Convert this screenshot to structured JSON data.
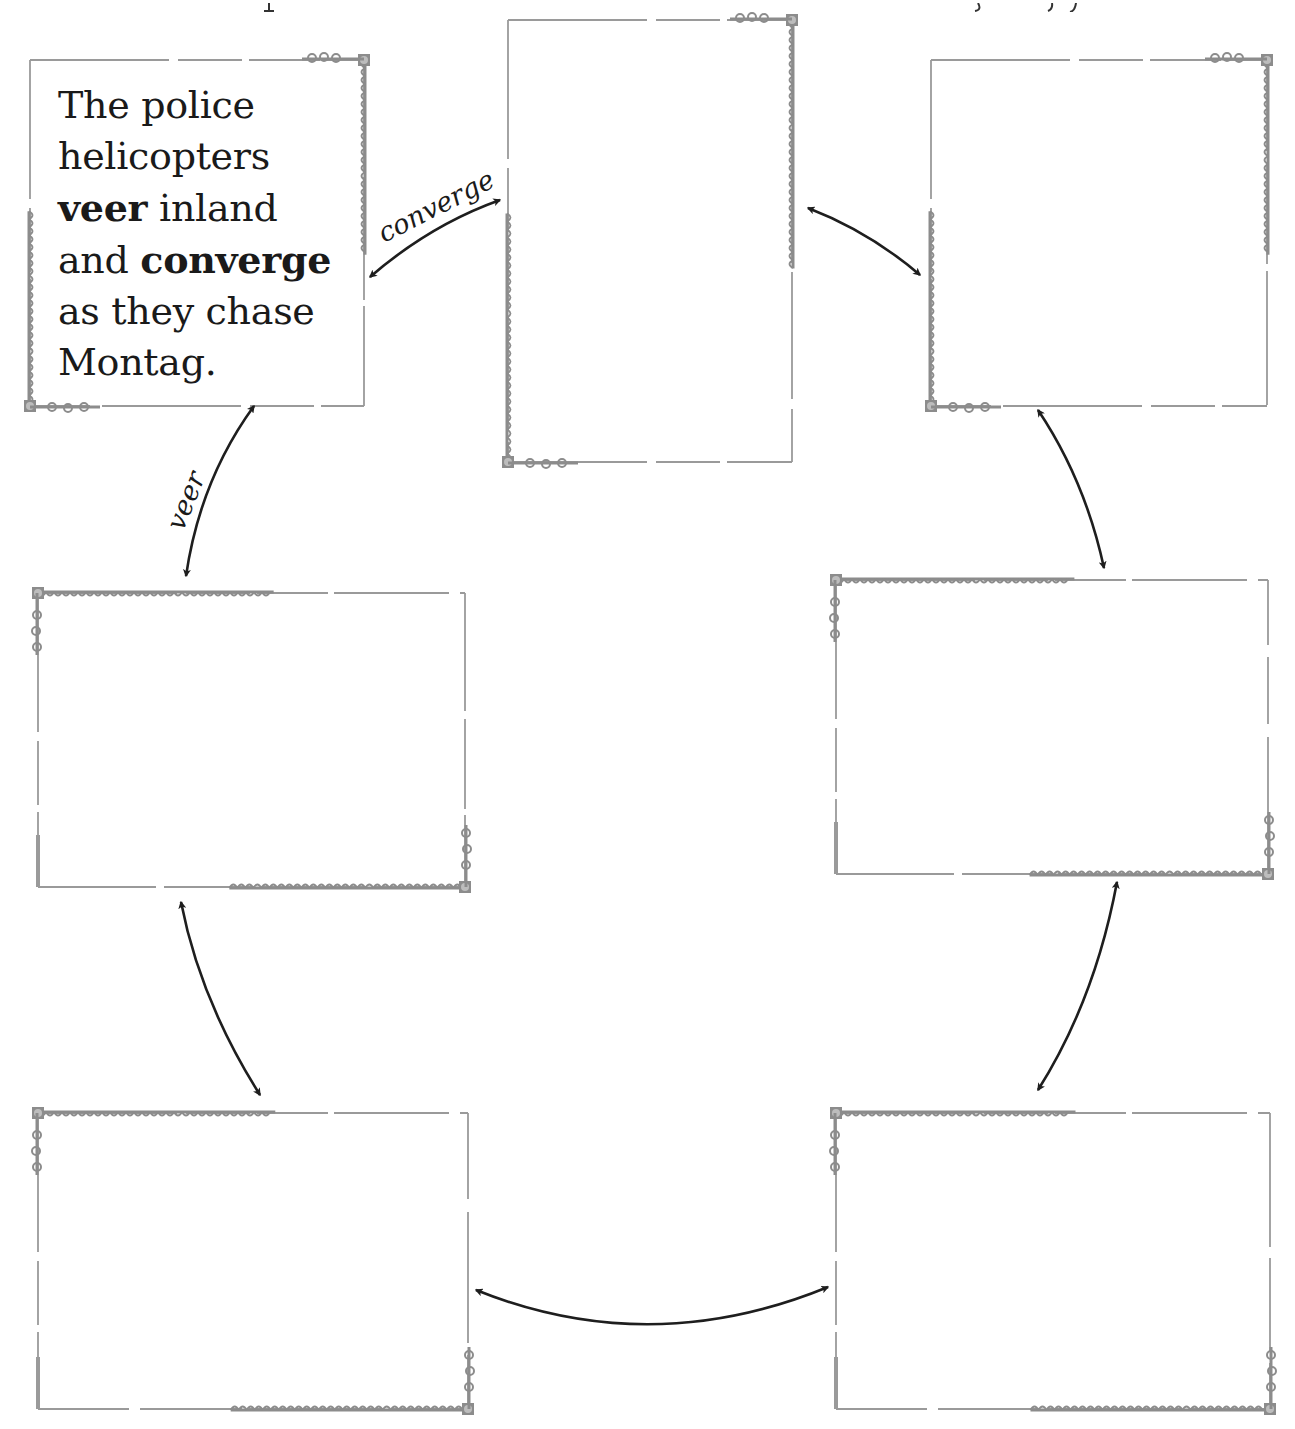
{
  "diagram": {
    "type": "word-chain graphic organizer",
    "frame_count": 7,
    "colors": {
      "frame_border": "#9a9a9a",
      "frame_ornament": "#8c8c8c",
      "arrow": "#1e1e1e",
      "text": "#1a1a1a",
      "background": "#ffffff"
    },
    "frames": [
      {
        "id": "frame-1",
        "position": "top-left",
        "lines": [
          {
            "parts": [
              {
                "text": "The police",
                "bold": false
              }
            ]
          },
          {
            "parts": [
              {
                "text": "helicopters",
                "bold": false
              }
            ]
          },
          {
            "parts": [
              {
                "text": "veer",
                "bold": true
              },
              {
                "text": " inland",
                "bold": false
              }
            ]
          },
          {
            "parts": [
              {
                "text": "and ",
                "bold": false
              },
              {
                "text": "converge",
                "bold": true
              }
            ]
          },
          {
            "parts": [
              {
                "text": "as they chase",
                "bold": false
              }
            ]
          },
          {
            "parts": [
              {
                "text": "Montag.",
                "bold": false
              }
            ]
          }
        ]
      },
      {
        "id": "frame-2",
        "position": "top-center",
        "lines": []
      },
      {
        "id": "frame-3",
        "position": "top-right",
        "lines": []
      },
      {
        "id": "frame-4",
        "position": "middle-left",
        "lines": []
      },
      {
        "id": "frame-5",
        "position": "middle-right",
        "lines": []
      },
      {
        "id": "frame-6",
        "position": "bottom-left",
        "lines": []
      },
      {
        "id": "frame-7",
        "position": "bottom-right",
        "lines": []
      }
    ],
    "connectors": [
      {
        "from": "frame-1",
        "to": "frame-2",
        "label": "converge",
        "bidirectional": true
      },
      {
        "from": "frame-2",
        "to": "frame-3",
        "label": "",
        "bidirectional": true
      },
      {
        "from": "frame-3",
        "to": "frame-5",
        "label": "",
        "bidirectional": true
      },
      {
        "from": "frame-5",
        "to": "frame-7",
        "label": "",
        "bidirectional": true
      },
      {
        "from": "frame-7",
        "to": "frame-6",
        "label": "",
        "bidirectional": true
      },
      {
        "from": "frame-6",
        "to": "frame-4",
        "label": "",
        "bidirectional": true
      },
      {
        "from": "frame-4",
        "to": "frame-1",
        "label": "veer",
        "bidirectional": true
      }
    ]
  },
  "frame1": {
    "line1": "The police",
    "line2": "helicopters",
    "line3_bold": "veer",
    "line3_rest": " inland",
    "line4_pre": "and ",
    "line4_bold": "converge",
    "line5": "as they chase",
    "line6": "Montag."
  },
  "labels": {
    "converge": "converge",
    "veer": "veer"
  }
}
